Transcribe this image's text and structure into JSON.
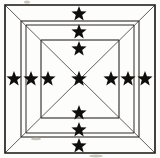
{
  "figure": {
    "title": "Nested squares with star cross",
    "background_color": "#fdfdfb",
    "line_color": "#15130f",
    "diagonal_color": "#3a362f",
    "star_color": "#100e0b",
    "canvas": {
      "width": 160,
      "height": 158
    }
  },
  "squares": [
    {
      "name": "outer-square",
      "x": 5,
      "y": 5,
      "width": 150,
      "height": 148,
      "stroke_width": 1.6
    },
    {
      "name": "second-square",
      "x": 21,
      "y": 21,
      "width": 118,
      "height": 116,
      "stroke_width": 1.0
    },
    {
      "name": "third-square",
      "x": 26,
      "y": 25,
      "width": 108,
      "height": 108,
      "stroke_width": 0.9
    },
    {
      "name": "inner-square",
      "x": 41,
      "y": 40,
      "width": 78,
      "height": 78,
      "stroke_width": 1.0
    }
  ],
  "diagonals": [
    {
      "name": "diagonal-tl-br",
      "x1": 6,
      "y1": 6,
      "x2": 154,
      "y2": 152
    },
    {
      "name": "diagonal-tr-bl",
      "x1": 154,
      "y1": 6,
      "x2": 6,
      "y2": 152
    }
  ],
  "stars": [
    {
      "id": "star-top-1",
      "position": "top-outer",
      "cx": 79,
      "cy": 14,
      "r": 8.0
    },
    {
      "id": "star-top-2",
      "position": "top-middle",
      "cx": 79,
      "cy": 32,
      "r": 8.0
    },
    {
      "id": "star-top-3",
      "position": "top-inner",
      "cx": 79,
      "cy": 49,
      "r": 8.0
    },
    {
      "id": "star-center",
      "position": "center",
      "cx": 79,
      "cy": 79,
      "r": 8.2
    },
    {
      "id": "star-bottom-3",
      "position": "bottom-inner",
      "cx": 79,
      "cy": 113,
      "r": 8.0
    },
    {
      "id": "star-bottom-2",
      "position": "bottom-middle",
      "cx": 79,
      "cy": 130,
      "r": 8.0
    },
    {
      "id": "star-bottom-1",
      "position": "bottom-outer",
      "cx": 79,
      "cy": 146,
      "r": 8.0
    },
    {
      "id": "star-left-1",
      "position": "left-outer",
      "cx": 14,
      "cy": 79,
      "r": 8.0
    },
    {
      "id": "star-left-2",
      "position": "left-middle",
      "cx": 31,
      "cy": 79,
      "r": 8.0
    },
    {
      "id": "star-left-3",
      "position": "left-inner",
      "cx": 48,
      "cy": 79,
      "r": 8.0
    },
    {
      "id": "star-right-3",
      "position": "right-inner",
      "cx": 111,
      "cy": 79,
      "r": 8.0
    },
    {
      "id": "star-right-2",
      "position": "right-middle",
      "cx": 128,
      "cy": 79,
      "r": 8.0
    },
    {
      "id": "star-right-1",
      "position": "right-outer",
      "cx": 145,
      "cy": 79,
      "r": 8.0
    }
  ],
  "star_counts": {
    "total": 13,
    "horizontal_row": 7,
    "vertical_column": 7,
    "shared_center": 1
  },
  "specks": [
    {
      "name": "speck-top",
      "cx": 27,
      "cy": 2,
      "rx": 3.0,
      "ry": 1.6
    },
    {
      "name": "speck-bottom",
      "cx": 96,
      "cy": 156,
      "rx": 7.0,
      "ry": 1.4
    },
    {
      "name": "speck-left",
      "cx": 36,
      "cy": 139,
      "rx": 5.0,
      "ry": 1.2
    }
  ]
}
